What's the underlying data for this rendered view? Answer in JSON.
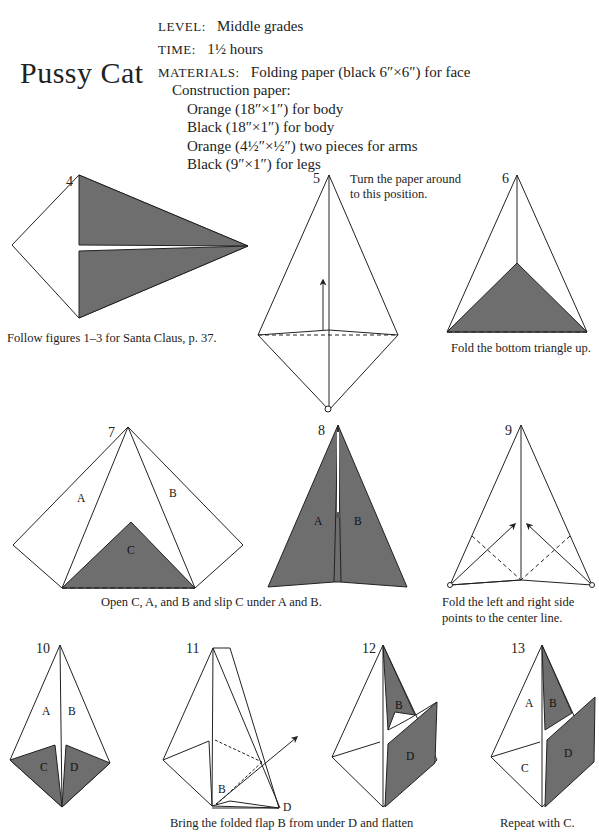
{
  "page": {
    "title": "Pussy Cat",
    "level_label": "LEVEL:",
    "level_value": "Middle grades",
    "time_label": "TIME:",
    "time_value": "1½ hours",
    "materials_label": "MATERIALS:",
    "materials_value": "Folding paper (black 6″×6″) for face",
    "construction_heading": "Construction paper:",
    "materials_list": [
      "Orange (18″×1″) for body",
      "Black (18″×1″) for body",
      "Orange (4½″×½″) two pieces for arms",
      "Black (9″×1″) for legs"
    ]
  },
  "colors": {
    "fill": "#6e6e6e",
    "line": "#222222",
    "background": "#ffffff"
  },
  "figures": [
    {
      "number": "4",
      "caption": "Follow figures 1–3 for Santa Claus, p. 37.",
      "labels": []
    },
    {
      "number": "5",
      "caption": "Turn the paper around to this position.",
      "caption_lines": [
        "Turn the paper around",
        "to this position."
      ],
      "labels": []
    },
    {
      "number": "6",
      "caption": "Fold the bottom triangle up.",
      "labels": []
    },
    {
      "number": "7",
      "caption": "Open C, A, and B and slip C under A and B.",
      "labels": [
        "A",
        "B",
        "C"
      ]
    },
    {
      "number": "8",
      "caption": "",
      "labels": [
        "A",
        "B"
      ]
    },
    {
      "number": "9",
      "caption": "Fold the left and right side points to the center line.",
      "caption_lines": [
        "Fold the left and right side",
        "points to the center line."
      ],
      "labels": []
    },
    {
      "number": "10",
      "caption": "",
      "labels": [
        "A",
        "B",
        "C",
        "D"
      ]
    },
    {
      "number": "11",
      "caption": "Bring the folded flap B from under D and flatten",
      "labels": [
        "B",
        "D"
      ]
    },
    {
      "number": "12",
      "caption": "",
      "labels": [
        "B",
        "D"
      ]
    },
    {
      "number": "13",
      "caption": "Repeat with C.",
      "labels": [
        "A",
        "B",
        "C",
        "D"
      ]
    }
  ]
}
